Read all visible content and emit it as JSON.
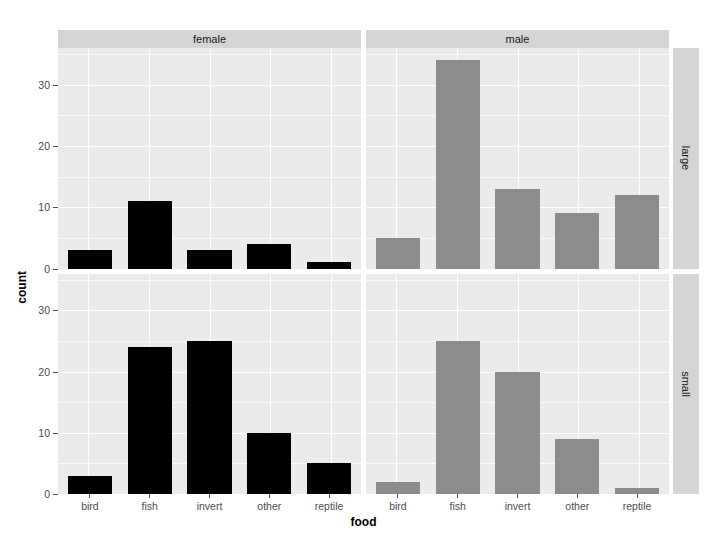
{
  "chart_data": {
    "type": "bar",
    "title": "",
    "xlabel": "food",
    "ylabel": "count",
    "categories": [
      "bird",
      "fish",
      "invert",
      "other",
      "reptile"
    ],
    "yticks": [
      0,
      10,
      20,
      30
    ],
    "ylim": [
      0,
      36
    ],
    "grid": true,
    "legend": null,
    "facet": {
      "columns_variable": "sex",
      "rows_variable": "size",
      "columns": [
        "female",
        "male"
      ],
      "rows": [
        "large",
        "small"
      ]
    },
    "colors": {
      "female_bar": "#000000",
      "male_bar": "#8c8c8c",
      "panel_background": "#ebebeb",
      "strip_background": "#d5d5d5",
      "gridline": "#ffffff",
      "figure_background": "#ffffff",
      "axis_text": "#4d4d4d"
    },
    "panels": [
      {
        "col": "female",
        "row": "large",
        "series": [
          {
            "name": "count",
            "values": [
              3,
              11,
              3,
              4,
              1
            ]
          }
        ]
      },
      {
        "col": "male",
        "row": "large",
        "series": [
          {
            "name": "count",
            "values": [
              5,
              34,
              13,
              9,
              12
            ]
          }
        ]
      },
      {
        "col": "female",
        "row": "small",
        "series": [
          {
            "name": "count",
            "values": [
              3,
              24,
              25,
              10,
              5
            ]
          }
        ]
      },
      {
        "col": "male",
        "row": "small",
        "series": [
          {
            "name": "count",
            "values": [
              2,
              25,
              20,
              9,
              1
            ]
          }
        ]
      }
    ]
  },
  "axes": {
    "y_tick_labels": [
      "0",
      "10",
      "20",
      "30"
    ],
    "x_tick_labels": [
      "bird",
      "fish",
      "invert",
      "other",
      "reptile"
    ],
    "y_title": "count",
    "x_title": "food"
  },
  "strips": {
    "top": [
      "female",
      "male"
    ],
    "right": [
      "large",
      "small"
    ]
  }
}
